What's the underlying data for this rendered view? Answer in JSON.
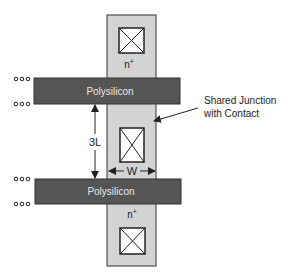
{
  "diagram": {
    "type": "layout-schematic",
    "colors": {
      "background": "#ffffff",
      "diffusion": "#d3d3d3",
      "polysilicon": "#555555",
      "outline": "#222222",
      "poly_text": "#e8e8e8",
      "contact_fill": "#ffffff",
      "label_text": "#222222"
    },
    "diffusion": {
      "label_top": "n",
      "label_top_sup": "+",
      "label_bottom": "n",
      "label_bottom_sup": "+"
    },
    "polysilicon_top": {
      "label": "Polysilicon"
    },
    "polysilicon_bottom": {
      "label": "Polysilicon"
    },
    "dimensions": {
      "vertical_label": "3L",
      "horizontal_label": "W"
    },
    "annotation": {
      "line1": "Shared Junction",
      "line2": "with Contact"
    },
    "continuation_dots": "ooo"
  }
}
